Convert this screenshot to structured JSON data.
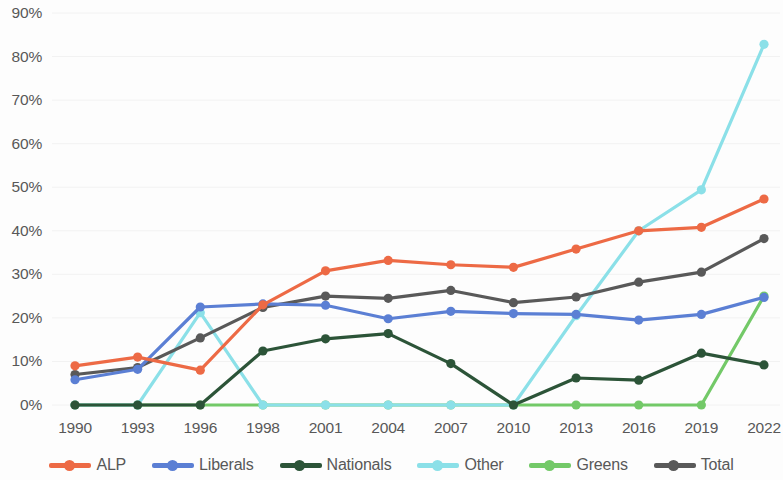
{
  "chart_data": {
    "type": "line",
    "title": "",
    "subtitle": "",
    "xlabel": "",
    "ylabel": "",
    "grid": false,
    "legend_position": "bottom",
    "ylim": [
      0,
      90
    ],
    "ytick_step": 10,
    "ytick_labels": [
      "0%",
      "10%",
      "20%",
      "30%",
      "40%",
      "50%",
      "60%",
      "70%",
      "80%",
      "90%"
    ],
    "ytick_values": [
      0,
      10,
      20,
      30,
      40,
      50,
      60,
      70,
      80,
      90
    ],
    "categories": [
      "1990",
      "1993",
      "1996",
      "1998",
      "2001",
      "2004",
      "2007",
      "2010",
      "2013",
      "2016",
      "2019",
      "2022"
    ],
    "x": [
      1990,
      1993,
      1996,
      1998,
      2001,
      2004,
      2007,
      2010,
      2013,
      2016,
      2019,
      2022
    ],
    "series": [
      {
        "name": "ALP",
        "color": "#ED6A45",
        "values": [
          9.0,
          11.0,
          8.0,
          23.0,
          30.8,
          33.2,
          32.2,
          31.6,
          35.8,
          40.0,
          40.8,
          47.3
        ]
      },
      {
        "name": "Liberals",
        "color": "#5B7FD4",
        "values": [
          5.8,
          8.2,
          22.5,
          23.2,
          22.9,
          19.8,
          21.5,
          21.0,
          20.8,
          19.5,
          20.8,
          24.7
        ]
      },
      {
        "name": "Nationals",
        "color": "#2C5438",
        "values": [
          0.0,
          0.0,
          0.0,
          12.4,
          15.2,
          16.4,
          9.5,
          0.0,
          6.2,
          5.7,
          11.9,
          9.2
        ]
      },
      {
        "name": "Other",
        "color": "#8BE0E8",
        "values": [
          0.0,
          0.0,
          21.2,
          0.0,
          0.0,
          0.0,
          0.0,
          0.0,
          20.5,
          40.0,
          49.4,
          82.8
        ]
      },
      {
        "name": "Greens",
        "color": "#73C968",
        "values": [
          0.0,
          0.0,
          0.0,
          0.0,
          0.0,
          0.0,
          0.0,
          0.0,
          0.0,
          0.0,
          0.0,
          25.0
        ]
      },
      {
        "name": "Total",
        "color": "#595959",
        "values": [
          7.0,
          8.6,
          15.4,
          22.4,
          25.0,
          24.5,
          26.3,
          23.5,
          24.8,
          28.2,
          30.5,
          38.2
        ]
      }
    ]
  },
  "axes": {
    "y_ticks": [
      {
        "label": "90%",
        "value": 90
      },
      {
        "label": "80%",
        "value": 80
      },
      {
        "label": "70%",
        "value": 70
      },
      {
        "label": "60%",
        "value": 60
      },
      {
        "label": "50%",
        "value": 50
      },
      {
        "label": "40%",
        "value": 40
      },
      {
        "label": "30%",
        "value": 30
      },
      {
        "label": "20%",
        "value": 20
      },
      {
        "label": "10%",
        "value": 10
      },
      {
        "label": "0%",
        "value": 0
      }
    ],
    "x_ticks": [
      {
        "label": "1990"
      },
      {
        "label": "1993"
      },
      {
        "label": "1996"
      },
      {
        "label": "1998"
      },
      {
        "label": "2001"
      },
      {
        "label": "2004"
      },
      {
        "label": "2007"
      },
      {
        "label": "2010"
      },
      {
        "label": "2013"
      },
      {
        "label": "2016"
      },
      {
        "label": "2019"
      },
      {
        "label": "2022"
      }
    ]
  },
  "legend": {
    "items": [
      {
        "label": "ALP",
        "color": "#ED6A45"
      },
      {
        "label": "Liberals",
        "color": "#5B7FD4"
      },
      {
        "label": "Nationals",
        "color": "#2C5438"
      },
      {
        "label": "Other",
        "color": "#8BE0E8"
      },
      {
        "label": "Greens",
        "color": "#73C968"
      },
      {
        "label": "Total",
        "color": "#595959"
      }
    ]
  }
}
